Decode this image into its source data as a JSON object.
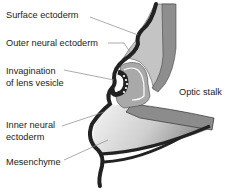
{
  "diagram": {
    "labels": {
      "surface_ectoderm": "Surface ectoderm",
      "outer_neural_ectoderm": "Outer neural ectoderm",
      "invagination_line1": "Invagination",
      "invagination_line2": "of lens vesicle",
      "inner_neural_line1": "Inner neural",
      "inner_neural_line2": "ectoderm",
      "mesenchyme": "Mesenchyme",
      "optic_stalk": "Optic stalk"
    },
    "colors": {
      "ectoderm": "#222222",
      "outer_neural": "#bdbdbd",
      "optic_stalk_fill": "#8c8c8c",
      "lens": "#a8a8a8",
      "mesenchyme_light": "#f2f2f2",
      "mesenchyme_dark": "#9a9a9a",
      "leader": "#888888"
    }
  }
}
